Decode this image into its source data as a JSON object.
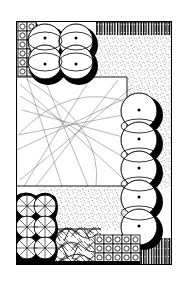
{
  "drawing": {
    "title": "Garden Site Plan",
    "type": "landscape-plan",
    "medium": "pen-and-ink line drawing",
    "canvas": {
      "width": 185,
      "height": 283,
      "background": "#ffffff"
    },
    "ink_color": "#000000",
    "plot_boundary": {
      "x": 16,
      "y": 21,
      "width": 156,
      "height": 244
    }
  },
  "surfaces": [
    {
      "name": "lawn",
      "label": "Lawn",
      "fill": "#ffffff",
      "shape": "rect",
      "x": 17,
      "y": 77,
      "width": 118,
      "height": 110
    },
    {
      "name": "gravel-paving",
      "label": "Gravel Paving",
      "fill": "#f2f2f2",
      "texture": "stipple",
      "regions": [
        {
          "x": 96,
          "y": 34,
          "width": 76,
          "height": 43
        },
        {
          "x": 128,
          "y": 34,
          "width": 44,
          "height": 153
        },
        {
          "x": 38,
          "y": 187,
          "width": 96,
          "height": 42
        }
      ]
    }
  ],
  "boundary_walls": [
    {
      "name": "fence-top-right",
      "label": "Fence / Wall",
      "texture": "vertical-hatch",
      "x": 96,
      "y": 22,
      "width": 76,
      "height": 13
    },
    {
      "name": "fence-bottom-right",
      "label": "Fence / Wall",
      "texture": "vertical-hatch",
      "x": 139,
      "y": 240,
      "width": 33,
      "height": 24
    }
  ],
  "tree_group_corner": {
    "name": "specimen-tree-cluster",
    "label": "Specimen Tree Cluster",
    "count": 4,
    "symbol": "circle-with-center-dot",
    "radius": 17,
    "shadow": "offset-black-blob",
    "trees": [
      {
        "id": 1,
        "cx": 45,
        "cy": 41,
        "r": 17
      },
      {
        "id": 2,
        "cx": 76,
        "cy": 41,
        "r": 17
      },
      {
        "id": 3,
        "cx": 45,
        "cy": 62,
        "r": 17
      },
      {
        "id": 4,
        "cx": 76,
        "cy": 62,
        "r": 17
      }
    ]
  },
  "tree_row_right": {
    "name": "tree-row-east",
    "label": "Tree Row (East Boundary)",
    "count": 5,
    "symbol": "circle-with-center-dot",
    "radius": 18,
    "shadow": "offset-black-crescent",
    "trees": [
      {
        "id": 1,
        "cx": 139,
        "cy": 111,
        "r": 18
      },
      {
        "id": 2,
        "cx": 139,
        "cy": 140,
        "r": 18
      },
      {
        "id": 3,
        "cx": 139,
        "cy": 169,
        "r": 18
      },
      {
        "id": 4,
        "cx": 139,
        "cy": 198,
        "r": 18
      },
      {
        "id": 5,
        "cx": 139,
        "cy": 227,
        "r": 18
      }
    ]
  },
  "shrub_block_west": {
    "name": "shrub-mass-southwest",
    "label": "Shrub Mass",
    "texture": "scribble-foliage",
    "x": 16,
    "y": 194,
    "width": 39,
    "height": 70,
    "lobes": [
      {
        "cx": 26,
        "cy": 205,
        "r": 11
      },
      {
        "cx": 45,
        "cy": 205,
        "r": 11
      },
      {
        "cx": 26,
        "cy": 226,
        "r": 11
      },
      {
        "cx": 45,
        "cy": 226,
        "r": 11
      },
      {
        "cx": 26,
        "cy": 247,
        "r": 11
      },
      {
        "cx": 45,
        "cy": 247,
        "r": 11
      }
    ]
  },
  "shrub_band_south": {
    "name": "shrub-band-south",
    "label": "Groundcover Band",
    "texture": "scribble-foliage",
    "x": 16,
    "y": 228,
    "width": 84,
    "height": 36
  },
  "hedge_column_west": {
    "name": "hedge-row-west",
    "label": "Clipped Hedge Row",
    "symbol": "square-with-circle",
    "columns": 2,
    "rows": 6,
    "cell": 9,
    "x": 18,
    "y": 22,
    "width": 18,
    "height": 54
  },
  "hedge_grid_south": {
    "name": "hedge-grid-south",
    "label": "Clipped Hedge Grid",
    "symbol": "square-with-circle",
    "columns": 5,
    "rows": 3,
    "cell": 9,
    "x": 95,
    "y": 235,
    "width": 45,
    "height": 27
  },
  "sight_lines": {
    "name": "sight-lines",
    "label": "Sight Lines / Layout Guides",
    "stroke": "#6a6a6a",
    "stroke_width": 0.5,
    "lines": [
      {
        "x1": 20,
        "y1": 84,
        "x2": 131,
        "y2": 186
      },
      {
        "x1": 20,
        "y1": 96,
        "x2": 133,
        "y2": 163
      },
      {
        "x1": 22,
        "y1": 110,
        "x2": 134,
        "y2": 140
      },
      {
        "x1": 27,
        "y1": 78,
        "x2": 62,
        "y2": 186
      },
      {
        "x1": 44,
        "y1": 78,
        "x2": 88,
        "y2": 186
      },
      {
        "x1": 90,
        "y1": 79,
        "x2": 24,
        "y2": 186
      },
      {
        "x1": 118,
        "y1": 80,
        "x2": 36,
        "y2": 186
      },
      {
        "x1": 131,
        "y1": 88,
        "x2": 20,
        "y2": 180
      },
      {
        "x1": 18,
        "y1": 135,
        "x2": 133,
        "y2": 113
      }
    ],
    "arcs": [
      {
        "x1": 19,
        "y1": 134,
        "cx": 70,
        "cy": 80,
        "x2": 132,
        "y2": 104
      },
      {
        "x1": 26,
        "y1": 79,
        "cx": 104,
        "cy": 128,
        "x2": 96,
        "y2": 186
      }
    ]
  },
  "legend": {
    "visible": false,
    "entries": []
  }
}
